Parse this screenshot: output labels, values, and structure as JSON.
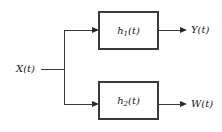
{
  "diagram": {
    "type": "block-diagram",
    "background_color": "#ffffff",
    "line_color": "#3a3a3a",
    "text_color": "#1a1a1a",
    "input": {
      "label_base": "X",
      "label_arg": "(t)",
      "label_full": "X(t)"
    },
    "blocks": [
      {
        "id": "h1",
        "label_base": "h",
        "label_sub": "1",
        "label_arg": "(t)",
        "label_full": "h1(t)",
        "position": "top"
      },
      {
        "id": "h2",
        "label_base": "h",
        "label_sub": "2",
        "label_arg": "(t)",
        "label_full": "h2(t)",
        "position": "bottom"
      }
    ],
    "outputs": [
      {
        "id": "y",
        "label_base": "Y",
        "label_arg": "(t)",
        "label_full": "Y(t)",
        "from_block": "h1"
      },
      {
        "id": "w",
        "label_base": "W",
        "label_arg": "(t)",
        "label_full": "W(t)",
        "from_block": "h2"
      }
    ],
    "junction": {
      "name": "signal-split-node",
      "x": 64,
      "y": 69
    }
  }
}
